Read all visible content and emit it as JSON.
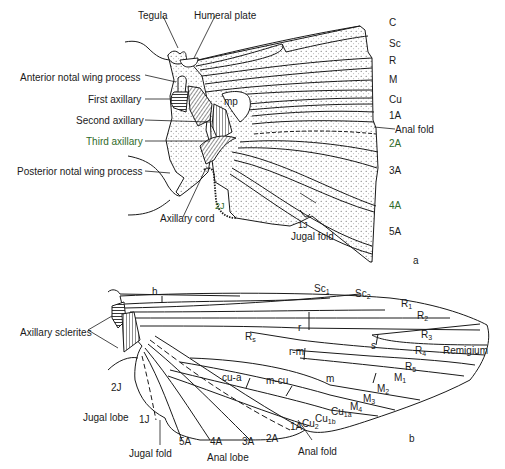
{
  "figure": {
    "panel_a": {
      "panel_label": "a",
      "left_labels": [
        {
          "text": "Tegula"
        },
        {
          "text": "Humeral plate"
        },
        {
          "text": "Anterior notal wing process"
        },
        {
          "text": "First axillary"
        },
        {
          "text": "Second axillary"
        },
        {
          "text": "Third axillary"
        },
        {
          "text": "Posterior notal wing process"
        },
        {
          "text": "Axillary cord"
        },
        {
          "text": "2J"
        },
        {
          "text": "mp"
        }
      ],
      "vein_labels": [
        "C",
        "Sc",
        "R",
        "M",
        "Cu",
        "1A",
        "2A",
        "3A",
        "4A",
        "5A"
      ],
      "anal_fold": "Anal fold",
      "jugal": {
        "j1": "1J",
        "fold": "Jugal fold"
      },
      "colors": {
        "green_label": "#2f6a2a",
        "dot_fill": "#f4f4f4",
        "line": "#1a1a1a"
      }
    },
    "panel_b": {
      "panel_label": "b",
      "axillary_sclerites": "Axillary sclerites",
      "h": "h",
      "sc1": {
        "base": "Sc",
        "sub": "1"
      },
      "sc2": {
        "base": "Sc",
        "sub": "2"
      },
      "r1": {
        "base": "R",
        "sub": "1"
      },
      "r2": {
        "base": "R",
        "sub": "2"
      },
      "r3": {
        "base": "R",
        "sub": "3"
      },
      "r4": {
        "base": "R",
        "sub": "4"
      },
      "r5": {
        "base": "R",
        "sub": "5"
      },
      "rs": {
        "base": "R",
        "sub": "s"
      },
      "m1": {
        "base": "M",
        "sub": "1"
      },
      "m2": {
        "base": "M",
        "sub": "2"
      },
      "m3": {
        "base": "M",
        "sub": "3"
      },
      "m4": {
        "base": "M",
        "sub": "4"
      },
      "cu1a": {
        "base": "Cu",
        "sub": "1a"
      },
      "cu1b": {
        "base": "Cu",
        "sub": "1b"
      },
      "cu2": {
        "base": "Cu",
        "sub": "2"
      },
      "crossveins": {
        "r": "r",
        "s": "s",
        "rm": "r-m",
        "m": "m",
        "mcu": "m-cu",
        "cua": "cu-a"
      },
      "remigium": "Remigium",
      "j2": "2J",
      "j1": "1J",
      "jugal_lobe": "Jugal lobe",
      "jugal_fold": "Jugal fold",
      "anal_lobe": "Anal lobe",
      "anal_fold": "Anal fold",
      "anal_veins": [
        "5A",
        "4A",
        "3A",
        "2A",
        "1A"
      ]
    }
  }
}
